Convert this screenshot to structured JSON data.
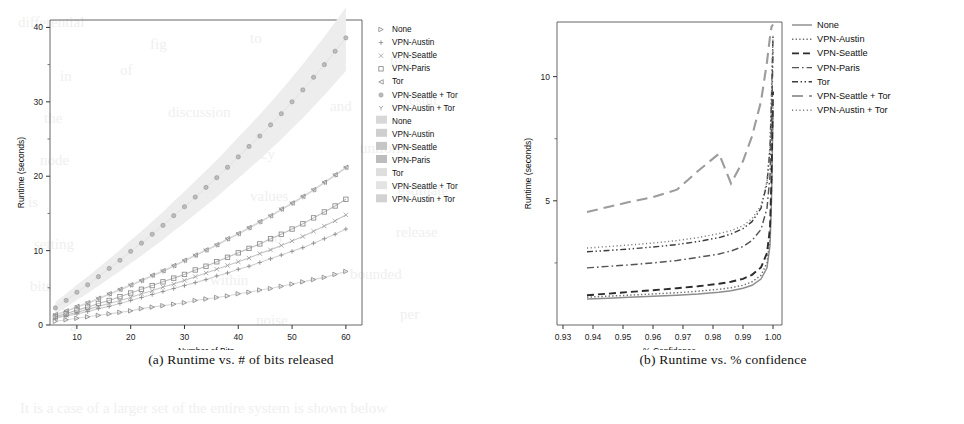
{
  "figure": {
    "panels": [
      {
        "id": "a",
        "caption": "(a) Runtime vs. # of bits released",
        "chart_ref": 0
      },
      {
        "id": "b",
        "caption": "(b) Runtime vs. % confidence",
        "chart_ref": 1
      }
    ]
  },
  "background_text": [
    {
      "t": "differential",
      "x": 18,
      "y": 14
    },
    {
      "t": "fig",
      "x": 150,
      "y": 36
    },
    {
      "t": "to",
      "x": 250,
      "y": 30
    },
    {
      "t": "on",
      "x": 330,
      "y": 22
    },
    {
      "t": "in",
      "x": 60,
      "y": 68
    },
    {
      "t": "of",
      "x": 120,
      "y": 62
    },
    {
      "t": "small",
      "x": 300,
      "y": 60
    },
    {
      "t": "then",
      "x": 390,
      "y": 52
    },
    {
      "t": "the",
      "x": 44,
      "y": 110
    },
    {
      "t": "discussion",
      "x": 168,
      "y": 104
    },
    {
      "t": "and",
      "x": 330,
      "y": 98
    },
    {
      "t": "result",
      "x": 404,
      "y": 92
    },
    {
      "t": "node",
      "x": 40,
      "y": 152
    },
    {
      "t": "privacy",
      "x": 230,
      "y": 146
    },
    {
      "t": "uniform",
      "x": 360,
      "y": 140
    },
    {
      "t": "is",
      "x": 28,
      "y": 194
    },
    {
      "t": "values",
      "x": 250,
      "y": 188
    },
    {
      "t": "estimate",
      "x": 398,
      "y": 182
    },
    {
      "t": "setting",
      "x": 34,
      "y": 236
    },
    {
      "t": "to",
      "x": 270,
      "y": 230
    },
    {
      "t": "release",
      "x": 396,
      "y": 224
    },
    {
      "t": "bits",
      "x": 30,
      "y": 278
    },
    {
      "t": "within",
      "x": 210,
      "y": 272
    },
    {
      "t": "bounded",
      "x": 350,
      "y": 266
    },
    {
      "t": "a",
      "x": 70,
      "y": 318
    },
    {
      "t": "noise",
      "x": 256,
      "y": 312
    },
    {
      "t": "per",
      "x": 400,
      "y": 306
    },
    {
      "t": "It is a case of a larger set of the entire system is shown below",
      "x": 20,
      "y": 400
    }
  ],
  "chart_data": [
    {
      "type": "scatter",
      "title": "",
      "xlabel": "Number of Bits",
      "ylabel": "Runtime (seconds)",
      "xlim": [
        5,
        63
      ],
      "ylim": [
        0,
        41
      ],
      "xticks": [
        10,
        20,
        30,
        40,
        50,
        60
      ],
      "yticks": [
        0,
        10,
        20,
        30,
        40
      ],
      "minor_yticks": [
        5,
        15,
        25,
        35
      ],
      "grid": false,
      "legend_position": "right",
      "legend_blocks": [
        {
          "name": "markers",
          "entries": [
            {
              "label": "None",
              "marker": "triangle-right-open",
              "color": "#8a8a8a"
            },
            {
              "label": "VPN-Austin",
              "marker": "plus",
              "color": "#8a8a8a"
            },
            {
              "label": "VPN-Seattle",
              "marker": "cross",
              "color": "#9a9a9a"
            },
            {
              "label": "VPN-Paris",
              "marker": "square-open",
              "color": "#8a8a8a"
            },
            {
              "label": "Tor",
              "marker": "triangle-left-open",
              "color": "#8a8a8a"
            },
            {
              "label": "VPN-Seattle + Tor",
              "marker": "circle-dotted",
              "color": "#9a9a9a"
            },
            {
              "label": "VPN-Austin + Tor",
              "marker": "y-glyph",
              "color": "#9a9a9a"
            }
          ]
        },
        {
          "name": "fit-lines",
          "entries": [
            {
              "label": "None",
              "swatch": "#d8d8d8"
            },
            {
              "label": "VPN-Austin",
              "swatch": "#cfcfcf"
            },
            {
              "label": "VPN-Seattle",
              "swatch": "#c6c6c6"
            },
            {
              "label": "VPN-Paris",
              "swatch": "#bdbdbd"
            },
            {
              "label": "Tor",
              "swatch": "#dedede"
            },
            {
              "label": "VPN-Seattle + Tor",
              "swatch": "#e4e4e4"
            },
            {
              "label": "VPN-Austin + Tor",
              "swatch": "#d2d2d2"
            }
          ]
        }
      ],
      "series": [
        {
          "name": "None",
          "marker": "triangle-right-open",
          "x": [
            6,
            8,
            10,
            12,
            14,
            16,
            18,
            20,
            22,
            24,
            26,
            28,
            30,
            32,
            34,
            36,
            38,
            40,
            42,
            44,
            46,
            48,
            50,
            52,
            54,
            56,
            58,
            60
          ],
          "y": [
            0.5,
            0.7,
            0.9,
            1.1,
            1.3,
            1.5,
            1.7,
            1.9,
            2.2,
            2.4,
            2.6,
            2.8,
            3.0,
            3.3,
            3.5,
            3.7,
            3.9,
            4.2,
            4.4,
            4.7,
            4.9,
            5.2,
            5.5,
            5.8,
            6.1,
            6.4,
            6.8,
            7.2
          ]
        },
        {
          "name": "VPN-Austin",
          "marker": "plus",
          "x": [
            6,
            8,
            10,
            12,
            14,
            16,
            18,
            20,
            22,
            24,
            26,
            28,
            30,
            32,
            34,
            36,
            38,
            40,
            42,
            44,
            46,
            48,
            50,
            52,
            54,
            56,
            58,
            60
          ],
          "y": [
            0.9,
            1.2,
            1.5,
            1.8,
            2.2,
            2.5,
            2.9,
            3.3,
            3.7,
            4.1,
            4.5,
            4.9,
            5.3,
            5.7,
            6.1,
            6.6,
            7.0,
            7.5,
            7.9,
            8.4,
            8.9,
            9.4,
            9.9,
            10.4,
            11.0,
            11.6,
            12.2,
            12.9
          ]
        },
        {
          "name": "VPN-Seattle",
          "marker": "cross",
          "x": [
            6,
            8,
            10,
            12,
            14,
            16,
            18,
            20,
            22,
            24,
            26,
            28,
            30,
            32,
            34,
            36,
            38,
            40,
            42,
            44,
            46,
            48,
            50,
            52,
            54,
            56,
            58,
            60
          ],
          "y": [
            1.0,
            1.3,
            1.7,
            2.1,
            2.5,
            2.9,
            3.3,
            3.7,
            4.2,
            4.6,
            5.1,
            5.5,
            6.0,
            6.5,
            7.0,
            7.5,
            8.0,
            8.5,
            9.0,
            9.6,
            10.1,
            10.7,
            11.3,
            11.9,
            12.6,
            13.3,
            14.0,
            14.8
          ]
        },
        {
          "name": "VPN-Paris",
          "marker": "square-open",
          "x": [
            6,
            8,
            10,
            12,
            14,
            16,
            18,
            20,
            22,
            24,
            26,
            28,
            30,
            32,
            34,
            36,
            38,
            40,
            42,
            44,
            46,
            48,
            50,
            52,
            54,
            56,
            58,
            60
          ],
          "y": [
            1.1,
            1.5,
            2.0,
            2.4,
            2.9,
            3.3,
            3.8,
            4.3,
            4.8,
            5.3,
            5.8,
            6.3,
            6.8,
            7.4,
            7.9,
            8.5,
            9.1,
            9.7,
            10.3,
            10.9,
            11.6,
            12.2,
            12.9,
            13.6,
            14.4,
            15.2,
            16.0,
            16.9
          ]
        },
        {
          "name": "Tor",
          "marker": "triangle-left-open",
          "x": [
            6,
            8,
            10,
            12,
            14,
            16,
            18,
            20,
            22,
            24,
            26,
            28,
            30,
            32,
            34,
            36,
            38,
            40,
            42,
            44,
            46,
            48,
            50,
            52,
            54,
            56,
            58,
            60
          ],
          "y": [
            1.4,
            1.9,
            2.5,
            3.0,
            3.6,
            4.2,
            4.8,
            5.4,
            6.0,
            6.7,
            7.3,
            8.0,
            8.7,
            9.4,
            10.1,
            10.8,
            11.6,
            12.3,
            13.1,
            13.9,
            14.7,
            15.6,
            16.4,
            17.3,
            18.2,
            19.2,
            20.2,
            21.2
          ]
        },
        {
          "name": "VPN-Seattle + Tor",
          "marker": "circle-dotted",
          "x": [
            6,
            8,
            10,
            12,
            14,
            16,
            18,
            20,
            22,
            24,
            26,
            28,
            30,
            32,
            34,
            36,
            38,
            40,
            42,
            44,
            46,
            48,
            50,
            52,
            54,
            56,
            58,
            60
          ],
          "y": [
            2.3,
            3.3,
            4.4,
            5.4,
            6.5,
            7.6,
            8.7,
            9.9,
            11.0,
            12.2,
            13.4,
            14.7,
            15.9,
            17.2,
            18.5,
            19.8,
            21.2,
            22.6,
            24.0,
            25.4,
            26.9,
            28.4,
            30.0,
            31.6,
            33.3,
            35.0,
            36.8,
            38.6
          ]
        },
        {
          "name": "VPN-Austin + Tor",
          "marker": "y-glyph",
          "x": [
            6,
            8,
            10,
            12,
            14,
            16,
            18,
            20,
            22,
            24,
            26,
            28,
            30,
            32,
            34,
            36,
            38,
            40,
            42,
            44,
            46,
            48,
            50,
            52,
            54,
            56,
            58,
            60
          ],
          "y": [
            1.3,
            1.8,
            2.4,
            2.9,
            3.5,
            4.1,
            4.7,
            5.3,
            5.9,
            6.6,
            7.2,
            7.9,
            8.6,
            9.3,
            10.0,
            10.7,
            11.5,
            12.2,
            13.0,
            13.8,
            14.6,
            15.5,
            16.3,
            17.2,
            18.1,
            19.1,
            20.1,
            21.1
          ]
        }
      ]
    },
    {
      "type": "line",
      "title": "",
      "xlabel": "% Confidence",
      "ylabel": "Runtime (seconds)",
      "xlim": [
        0.928,
        1.003
      ],
      "ylim": [
        0,
        12.2
      ],
      "xticks": [
        0.93,
        0.94,
        0.95,
        0.96,
        0.97,
        0.98,
        0.99,
        1.0
      ],
      "xtick_labels": [
        "0.93",
        "0.94",
        "0.95",
        "0.96",
        "0.97",
        "0.98",
        "0.99",
        "1.00"
      ],
      "yticks": [
        5,
        10
      ],
      "minor_yticks": [
        2.5,
        7.5
      ],
      "grid": false,
      "legend_position": "top-right",
      "legend_entries": [
        {
          "label": "None",
          "style": "solid",
          "color": "#8d8d8d"
        },
        {
          "label": "VPN-Austin",
          "style": "dotted",
          "color": "#6f6f6f"
        },
        {
          "label": "VPN-Seattle",
          "style": "dashed",
          "color": "#2c2c2c"
        },
        {
          "label": "VPN-Paris",
          "style": "dashdot",
          "color": "#555555"
        },
        {
          "label": "Tor",
          "style": "dashdotdot",
          "color": "#3d3d3d"
        },
        {
          "label": "VPN-Seattle + Tor",
          "style": "longdash",
          "color": "#9c9c9c"
        },
        {
          "label": "VPN-Austin + Tor",
          "style": "finedot",
          "color": "#7a7a7a"
        }
      ],
      "x": [
        0.938,
        0.945,
        0.952,
        0.96,
        0.968,
        0.975,
        0.982,
        0.986,
        0.99,
        0.993,
        0.996,
        0.998,
        0.999,
        0.9995,
        1.0
      ],
      "series": [
        {
          "name": "None",
          "values": [
            1.05,
            1.08,
            1.12,
            1.16,
            1.2,
            1.25,
            1.32,
            1.38,
            1.48,
            1.6,
            1.85,
            2.3,
            3.2,
            5.0,
            8.6
          ]
        },
        {
          "name": "VPN-Austin",
          "values": [
            1.12,
            1.16,
            1.2,
            1.25,
            1.3,
            1.36,
            1.44,
            1.5,
            1.6,
            1.74,
            2.0,
            2.5,
            3.5,
            5.4,
            9.0
          ]
        },
        {
          "name": "VPN-Seattle",
          "values": [
            1.2,
            1.26,
            1.33,
            1.4,
            1.48,
            1.56,
            1.66,
            1.74,
            1.86,
            2.02,
            2.32,
            2.9,
            3.9,
            5.9,
            9.4
          ]
        },
        {
          "name": "VPN-Paris",
          "values": [
            2.3,
            2.36,
            2.42,
            2.5,
            2.6,
            2.72,
            2.86,
            2.98,
            3.16,
            3.4,
            3.85,
            4.7,
            6.0,
            8.0,
            11.0
          ]
        },
        {
          "name": "Tor",
          "values": [
            2.95,
            3.0,
            3.06,
            3.14,
            3.24,
            3.36,
            3.52,
            3.66,
            3.88,
            4.16,
            4.7,
            5.7,
            7.1,
            9.1,
            11.6
          ]
        },
        {
          "name": "VPN-Seattle + Tor",
          "values": [
            4.55,
            4.75,
            4.95,
            5.15,
            5.45,
            6.2,
            6.9,
            5.7,
            6.6,
            7.6,
            9.0,
            10.6,
            11.6,
            12.0,
            12.1
          ]
        },
        {
          "name": "VPN-Austin + Tor",
          "values": [
            3.1,
            3.16,
            3.22,
            3.3,
            3.4,
            3.52,
            3.68,
            3.8,
            4.0,
            4.28,
            4.8,
            5.8,
            7.2,
            9.2,
            11.7
          ]
        }
      ]
    }
  ]
}
